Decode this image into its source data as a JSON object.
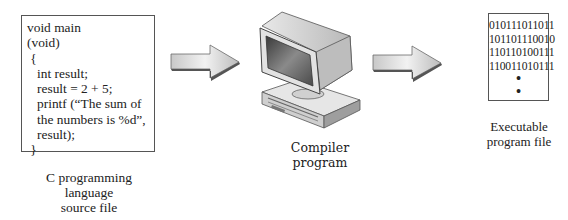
{
  "diagram": {
    "source_file": {
      "code_lines": [
        "void main",
        "(void)",
        " {",
        "   int result;",
        "   result = 2 + 5;",
        "   printf (“The sum of",
        "   the numbers is %d”,",
        "   result);",
        " }"
      ],
      "caption_lines": [
        "C programming",
        "language",
        "source file"
      ]
    },
    "arrow_1": {
      "icon": "right-arrow-icon"
    },
    "compiler": {
      "icon": "computer-icon",
      "caption_lines": [
        "Compiler",
        "program"
      ]
    },
    "arrow_2": {
      "icon": "right-arrow-icon"
    },
    "executable_file": {
      "binary_lines": [
        "010111011011",
        "101101110010",
        "110110100111",
        "110011010111"
      ],
      "continuation": [
        "•",
        "•"
      ],
      "caption_lines": [
        "Executable",
        "program file"
      ]
    }
  }
}
